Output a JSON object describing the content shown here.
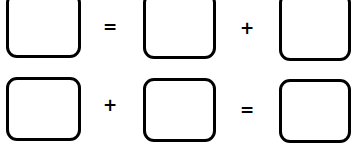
{
  "puzzle": {
    "row1": {
      "operator1": "=",
      "operator2": "+"
    },
    "row2": {
      "operator1": "+",
      "operator2": "="
    }
  },
  "colors": {
    "stroke": "#000000",
    "background": "#ffffff"
  }
}
